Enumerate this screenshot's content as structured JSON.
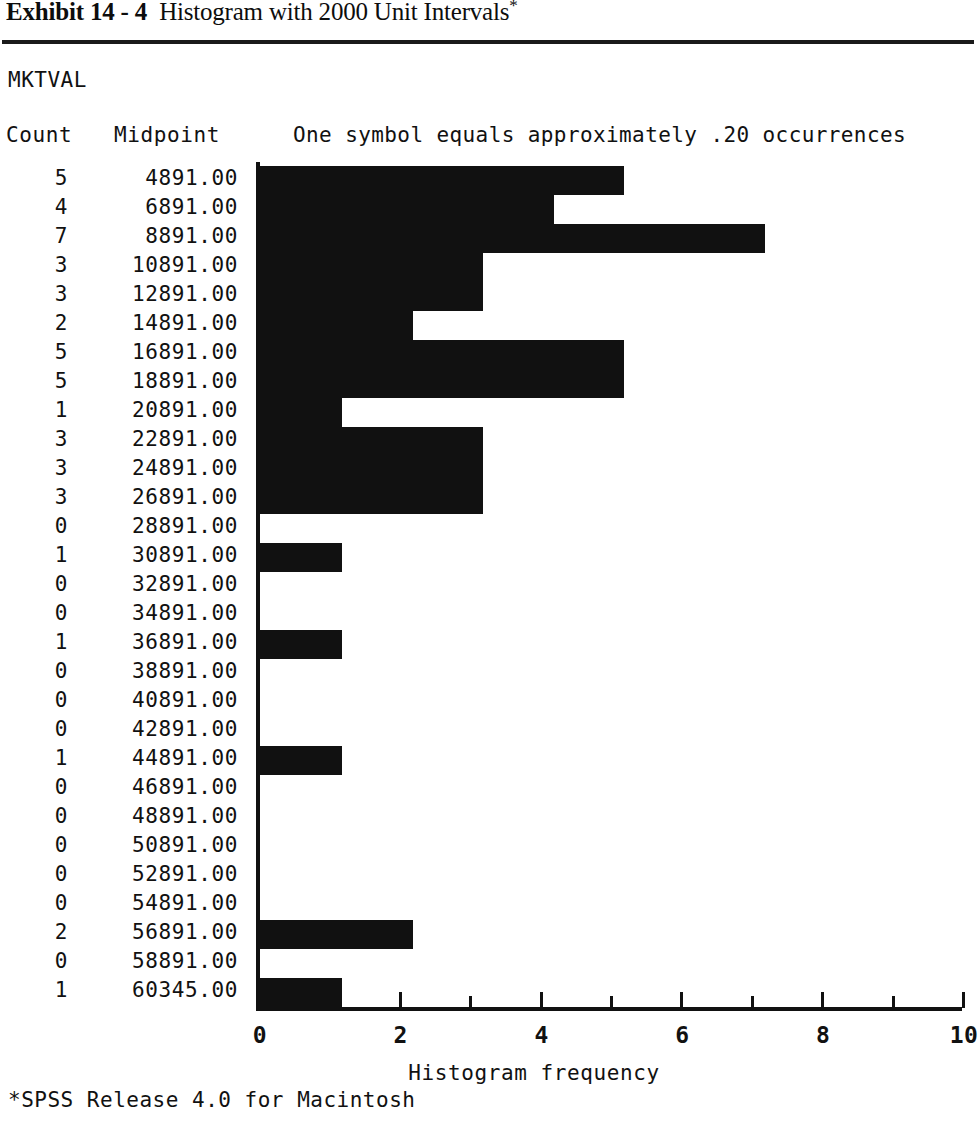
{
  "exhibit": {
    "label": "Exhibit",
    "number": "14 - 4",
    "title": "Histogram with 2000 Unit Intervals",
    "star": "*",
    "full_title": "Exhibit 14 - 4  Histogram with 2000 Unit Intervals *"
  },
  "report": {
    "variable_name": "MKTVAL",
    "header_count": "Count",
    "header_midpoint": "Midpoint",
    "symbol_legend": "One symbol equals approximately .20 occurrences"
  },
  "footnote": "*SPSS Release 4.0 for Macintosh",
  "colors": {
    "bar": "#111111",
    "axis": "#111111",
    "text": "#111111",
    "background": "#ffffff"
  },
  "chart_data": {
    "type": "bar",
    "orientation": "horizontal",
    "title": "Histogram with 2000 Unit Intervals",
    "variable": "MKTVAL",
    "xlabel": "Histogram frequency",
    "ylabel": "Midpoint",
    "xlim": [
      0,
      10
    ],
    "xticks": [
      0,
      1,
      2,
      3,
      4,
      5,
      6,
      7,
      8,
      9,
      10
    ],
    "xtick_labels": [
      "0",
      "",
      "2",
      "",
      "4",
      "",
      "6",
      "",
      "8",
      "",
      "10"
    ],
    "grid": false,
    "legend": "One symbol equals approximately .20 occurrences",
    "symbol_scale": 0.2,
    "categories": [
      "4891.00",
      "6891.00",
      "8891.00",
      "10891.00",
      "12891.00",
      "14891.00",
      "16891.00",
      "18891.00",
      "20891.00",
      "22891.00",
      "24891.00",
      "26891.00",
      "28891.00",
      "30891.00",
      "32891.00",
      "34891.00",
      "36891.00",
      "38891.00",
      "40891.00",
      "42891.00",
      "44891.00",
      "46891.00",
      "48891.00",
      "50891.00",
      "52891.00",
      "54891.00",
      "56891.00",
      "58891.00",
      "60345.00"
    ],
    "values": [
      5,
      4,
      7,
      3,
      3,
      2,
      5,
      5,
      1,
      3,
      3,
      3,
      0,
      1,
      0,
      0,
      1,
      0,
      0,
      0,
      1,
      0,
      0,
      0,
      0,
      0,
      2,
      0,
      1
    ],
    "rows": [
      {
        "count": "5",
        "midpoint": "4891.00",
        "value": 5
      },
      {
        "count": "4",
        "midpoint": "6891.00",
        "value": 4
      },
      {
        "count": "7",
        "midpoint": "8891.00",
        "value": 7
      },
      {
        "count": "3",
        "midpoint": "10891.00",
        "value": 3
      },
      {
        "count": "3",
        "midpoint": "12891.00",
        "value": 3
      },
      {
        "count": "2",
        "midpoint": "14891.00",
        "value": 2
      },
      {
        "count": "5",
        "midpoint": "16891.00",
        "value": 5
      },
      {
        "count": "5",
        "midpoint": "18891.00",
        "value": 5
      },
      {
        "count": "1",
        "midpoint": "20891.00",
        "value": 1
      },
      {
        "count": "3",
        "midpoint": "22891.00",
        "value": 3
      },
      {
        "count": "3",
        "midpoint": "24891.00",
        "value": 3
      },
      {
        "count": "3",
        "midpoint": "26891.00",
        "value": 3
      },
      {
        "count": "0",
        "midpoint": "28891.00",
        "value": 0
      },
      {
        "count": "1",
        "midpoint": "30891.00",
        "value": 1
      },
      {
        "count": "0",
        "midpoint": "32891.00",
        "value": 0
      },
      {
        "count": "0",
        "midpoint": "34891.00",
        "value": 0
      },
      {
        "count": "1",
        "midpoint": "36891.00",
        "value": 1
      },
      {
        "count": "0",
        "midpoint": "38891.00",
        "value": 0
      },
      {
        "count": "0",
        "midpoint": "40891.00",
        "value": 0
      },
      {
        "count": "0",
        "midpoint": "42891.00",
        "value": 0
      },
      {
        "count": "1",
        "midpoint": "44891.00",
        "value": 1
      },
      {
        "count": "0",
        "midpoint": "46891.00",
        "value": 0
      },
      {
        "count": "0",
        "midpoint": "48891.00",
        "value": 0
      },
      {
        "count": "0",
        "midpoint": "50891.00",
        "value": 0
      },
      {
        "count": "0",
        "midpoint": "52891.00",
        "value": 0
      },
      {
        "count": "0",
        "midpoint": "54891.00",
        "value": 0
      },
      {
        "count": "2",
        "midpoint": "56891.00",
        "value": 2
      },
      {
        "count": "0",
        "midpoint": "58891.00",
        "value": 0
      },
      {
        "count": "1",
        "midpoint": "60345.00",
        "value": 1
      }
    ]
  }
}
